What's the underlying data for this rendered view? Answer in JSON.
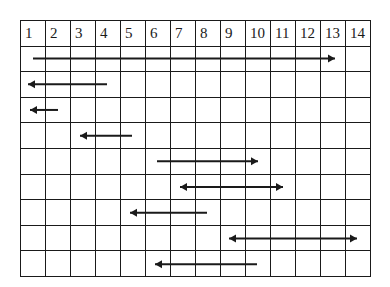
{
  "grid": {
    "columns": [
      "1",
      "2",
      "3",
      "4",
      "5",
      "6",
      "7",
      "8",
      "9",
      "10",
      "11",
      "12",
      "13",
      "14"
    ],
    "body_rows": 9
  },
  "arrows": [
    {
      "row": 1,
      "x1": 33,
      "x2": 335,
      "head": "right"
    },
    {
      "row": 2,
      "x1": 28,
      "x2": 107,
      "head": "left"
    },
    {
      "row": 3,
      "x1": 30,
      "x2": 58,
      "head": "left"
    },
    {
      "row": 4,
      "x1": 80,
      "x2": 132,
      "head": "left"
    },
    {
      "row": 5,
      "x1": 157,
      "x2": 258,
      "head": "right"
    },
    {
      "row": 6,
      "x1": 180,
      "x2": 283,
      "head": "both"
    },
    {
      "row": 7,
      "x1": 130,
      "x2": 207,
      "head": "left"
    },
    {
      "row": 8,
      "x1": 229,
      "x2": 357,
      "head": "both"
    },
    {
      "row": 9,
      "x1": 155,
      "x2": 257,
      "head": "left"
    }
  ],
  "colors": {
    "line": "#1a1a1a",
    "background": "#ffffff"
  }
}
